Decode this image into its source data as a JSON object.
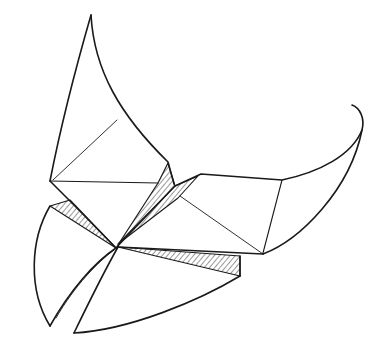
{
  "image": {
    "description": "Pen-and-ink line drawing of an origami butterfly-like folded paper figure with curved wing tips and hatched shading along fold creases",
    "background": "#ffffff",
    "stroke": "#1a1a1a",
    "hatch": "#333333"
  }
}
